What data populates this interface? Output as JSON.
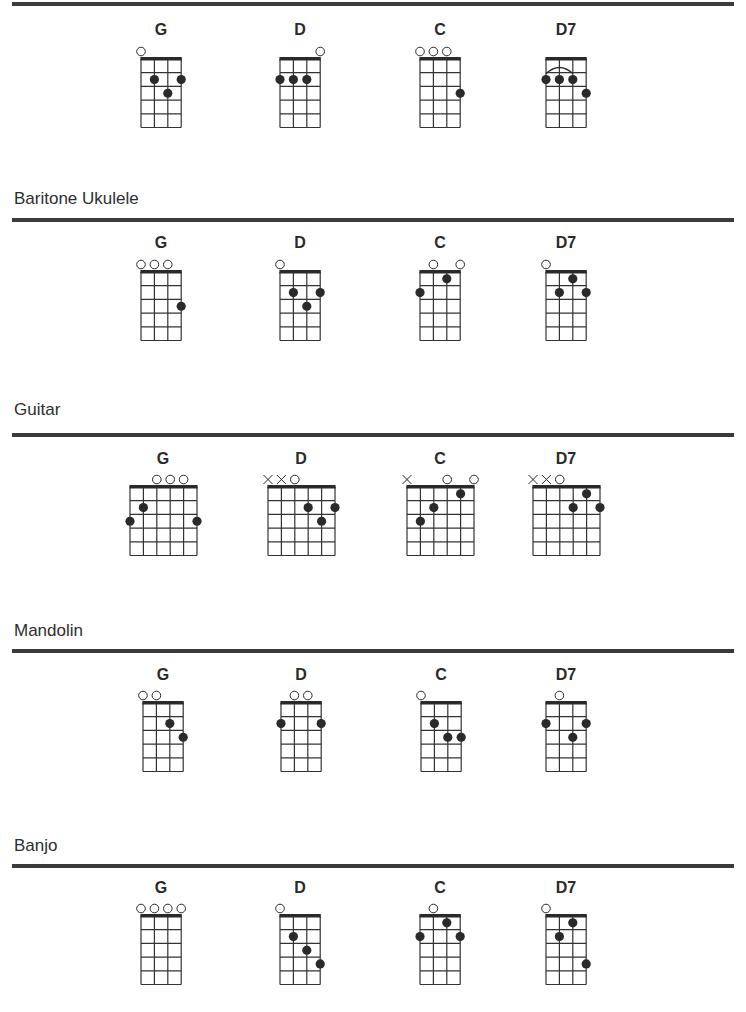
{
  "sections": [
    {
      "instrument": "Ukulele",
      "title": "",
      "title_y": null,
      "rule_y": 2,
      "label_y": 21,
      "nut_y": 59,
      "strings": 4,
      "frets": 5,
      "chords": [
        {
          "name": "G",
          "center_x": 161,
          "open": [
            1,
            0,
            0,
            0
          ],
          "muted": [
            0,
            0,
            0,
            0
          ],
          "dots": [
            [
              2,
              2
            ],
            [
              3,
              3
            ],
            [
              4,
              2
            ]
          ],
          "arc": null
        },
        {
          "name": "D",
          "center_x": 300,
          "open": [
            0,
            0,
            0,
            1
          ],
          "muted": [
            0,
            0,
            0,
            0
          ],
          "dots": [
            [
              1,
              2
            ],
            [
              2,
              2
            ],
            [
              3,
              2
            ]
          ],
          "arc": null
        },
        {
          "name": "C",
          "center_x": 440,
          "open": [
            1,
            1,
            1,
            0
          ],
          "muted": [
            0,
            0,
            0,
            0
          ],
          "dots": [
            [
              4,
              3
            ]
          ],
          "arc": null
        },
        {
          "name": "D7",
          "center_x": 566,
          "open": [
            0,
            0,
            0,
            0
          ],
          "muted": [
            0,
            0,
            0,
            0
          ],
          "dots": [
            [
              1,
              2
            ],
            [
              2,
              2
            ],
            [
              3,
              2
            ],
            [
              4,
              3
            ]
          ],
          "arc": [
            1,
            3,
            2
          ]
        }
      ]
    },
    {
      "instrument": "Baritone Ukulele",
      "title": "Baritone Ukulele",
      "title_y": 189,
      "rule_y": 218,
      "label_y": 234,
      "nut_y": 272,
      "strings": 4,
      "frets": 5,
      "chords": [
        {
          "name": "G",
          "center_x": 161,
          "open": [
            1,
            1,
            1,
            0
          ],
          "muted": [
            0,
            0,
            0,
            0
          ],
          "dots": [
            [
              4,
              3
            ]
          ],
          "arc": null
        },
        {
          "name": "D",
          "center_x": 300,
          "open": [
            1,
            0,
            0,
            0
          ],
          "muted": [
            0,
            0,
            0,
            0
          ],
          "dots": [
            [
              2,
              2
            ],
            [
              3,
              3
            ],
            [
              4,
              2
            ]
          ],
          "arc": null
        },
        {
          "name": "C",
          "center_x": 440,
          "open": [
            0,
            1,
            0,
            1
          ],
          "muted": [
            0,
            0,
            0,
            0
          ],
          "dots": [
            [
              1,
              2
            ],
            [
              3,
              1
            ]
          ],
          "arc": null
        },
        {
          "name": "D7",
          "center_x": 566,
          "open": [
            1,
            0,
            0,
            0
          ],
          "muted": [
            0,
            0,
            0,
            0
          ],
          "dots": [
            [
              2,
              2
            ],
            [
              3,
              1
            ],
            [
              4,
              2
            ]
          ],
          "arc": null
        }
      ]
    },
    {
      "instrument": "Guitar",
      "title": "Guitar",
      "title_y": 400,
      "rule_y": 433,
      "label_y": 450,
      "nut_y": 487,
      "strings": 6,
      "frets": 5,
      "chords": [
        {
          "name": "G",
          "center_x": 163,
          "open": [
            0,
            0,
            1,
            1,
            1,
            0
          ],
          "muted": [
            0,
            0,
            0,
            0,
            0,
            0
          ],
          "dots": [
            [
              1,
              3
            ],
            [
              2,
              2
            ],
            [
              6,
              3
            ]
          ],
          "arc": null
        },
        {
          "name": "D",
          "center_x": 301,
          "open": [
            0,
            0,
            1,
            0,
            0,
            0
          ],
          "muted": [
            1,
            1,
            0,
            0,
            0,
            0
          ],
          "dots": [
            [
              4,
              2
            ],
            [
              5,
              3
            ],
            [
              6,
              2
            ]
          ],
          "arc": null
        },
        {
          "name": "C",
          "center_x": 440,
          "open": [
            0,
            0,
            0,
            1,
            0,
            1
          ],
          "muted": [
            1,
            0,
            0,
            0,
            0,
            0
          ],
          "dots": [
            [
              2,
              3
            ],
            [
              3,
              2
            ],
            [
              5,
              1
            ]
          ],
          "arc": null
        },
        {
          "name": "D7",
          "center_x": 566,
          "open": [
            0,
            0,
            1,
            0,
            0,
            0
          ],
          "muted": [
            1,
            1,
            0,
            0,
            0,
            0
          ],
          "dots": [
            [
              4,
              2
            ],
            [
              5,
              1
            ],
            [
              6,
              2
            ]
          ],
          "arc": null
        }
      ]
    },
    {
      "instrument": "Mandolin",
      "title": "Mandolin",
      "title_y": 621,
      "rule_y": 649,
      "label_y": 666,
      "nut_y": 703,
      "strings": 4,
      "frets": 5,
      "chords": [
        {
          "name": "G",
          "center_x": 163,
          "open": [
            1,
            1,
            0,
            0
          ],
          "muted": [
            0,
            0,
            0,
            0
          ],
          "dots": [
            [
              3,
              2
            ],
            [
              4,
              3
            ]
          ],
          "arc": null
        },
        {
          "name": "D",
          "center_x": 301,
          "open": [
            0,
            1,
            1,
            0
          ],
          "muted": [
            0,
            0,
            0,
            0
          ],
          "dots": [
            [
              1,
              2
            ],
            [
              4,
              2
            ]
          ],
          "arc": null
        },
        {
          "name": "C",
          "center_x": 441,
          "open": [
            1,
            0,
            0,
            0
          ],
          "muted": [
            0,
            0,
            0,
            0
          ],
          "dots": [
            [
              2,
              2
            ],
            [
              3,
              3
            ],
            [
              4,
              3
            ]
          ],
          "arc": null
        },
        {
          "name": "D7",
          "center_x": 566,
          "open": [
            0,
            1,
            0,
            0
          ],
          "muted": [
            0,
            0,
            0,
            0
          ],
          "dots": [
            [
              1,
              2
            ],
            [
              3,
              3
            ],
            [
              4,
              2
            ]
          ],
          "arc": null
        }
      ]
    },
    {
      "instrument": "Banjo",
      "title": "Banjo",
      "title_y": 836,
      "rule_y": 864,
      "label_y": 879,
      "nut_y": 916,
      "strings": 4,
      "frets": 5,
      "chords": [
        {
          "name": "G",
          "center_x": 161,
          "open": [
            1,
            1,
            1,
            1
          ],
          "muted": [
            0,
            0,
            0,
            0
          ],
          "dots": [],
          "arc": null
        },
        {
          "name": "D",
          "center_x": 300,
          "open": [
            1,
            0,
            0,
            0
          ],
          "muted": [
            0,
            0,
            0,
            0
          ],
          "dots": [
            [
              2,
              2
            ],
            [
              3,
              3
            ],
            [
              4,
              4
            ]
          ],
          "arc": null
        },
        {
          "name": "C",
          "center_x": 440,
          "open": [
            0,
            1,
            0,
            0
          ],
          "muted": [
            0,
            0,
            0,
            0
          ],
          "dots": [
            [
              1,
              2
            ],
            [
              3,
              1
            ],
            [
              4,
              2
            ]
          ],
          "arc": null
        },
        {
          "name": "D7",
          "center_x": 566,
          "open": [
            1,
            0,
            0,
            0
          ],
          "muted": [
            0,
            0,
            0,
            0
          ],
          "dots": [
            [
              2,
              2
            ],
            [
              3,
              1
            ],
            [
              4,
              4
            ]
          ],
          "arc": null
        }
      ]
    }
  ],
  "style": {
    "ink": "#2a2a2a",
    "rule": "#3a3a3a",
    "grid_line": "#333333",
    "string_spacing": 13.4,
    "fret_spacing": 13.7,
    "dot_radius": 4.6,
    "open_radius": 4.3
  }
}
